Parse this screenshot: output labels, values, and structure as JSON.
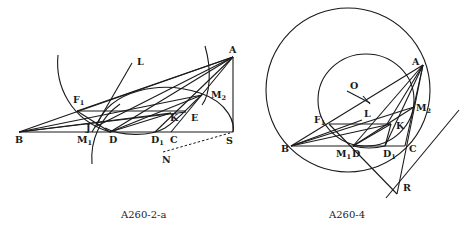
{
  "figures": [
    {
      "caption": "A260-2-a",
      "labels": {
        "A": "A",
        "B": "B",
        "C": "C",
        "D": "D",
        "D1": "D",
        "D1_sub": "1",
        "E": "E",
        "F1": "F",
        "F1_sub": "1",
        "J": "J",
        "K": "K",
        "L": "L",
        "M1": "M",
        "M1_sub": "1",
        "M2": "M",
        "M2_sub": "2",
        "N": "N",
        "S": "S"
      }
    },
    {
      "caption": "A260-4",
      "labels": {
        "A": "A",
        "B": "B",
        "C": "C",
        "D": "D",
        "D1": "D",
        "D1_sub": "1",
        "F1": "F",
        "F1_sub": "1",
        "K": "K",
        "L": "L",
        "M1": "M",
        "M1_sub": "1",
        "M2": "M",
        "M2_sub": "2",
        "O": "O",
        "R": "R"
      }
    }
  ]
}
